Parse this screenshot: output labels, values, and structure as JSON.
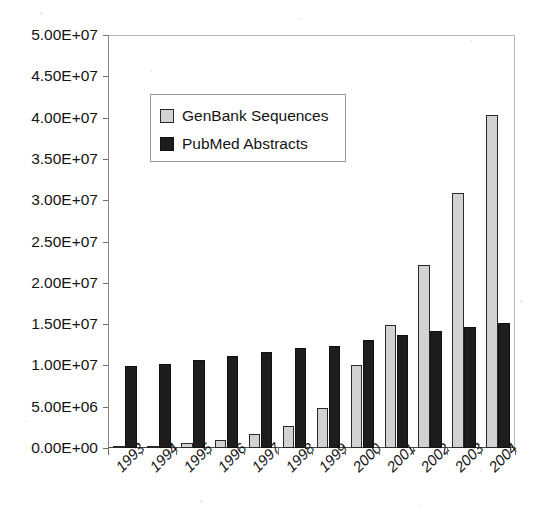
{
  "chart_data": {
    "type": "bar",
    "title": "",
    "subtitle": "",
    "xlabel": "",
    "ylabel": "",
    "categories": [
      "1993",
      "1994",
      "1995",
      "1996",
      "1997",
      "1998",
      "1999",
      "2000",
      "2001",
      "2002",
      "2003",
      "2004"
    ],
    "series": [
      {
        "name": "GenBank Sequences",
        "color": "#d2d2d2",
        "values": [
          160000,
          280000,
          560000,
          1020000,
          1750000,
          2650000,
          4800000,
          10100000,
          14900000,
          22200000,
          30900000,
          40300000
        ]
      },
      {
        "name": "PubMed Abstracts",
        "color": "#1d1d1d",
        "values": [
          9900000,
          10200000,
          10650000,
          11150000,
          11600000,
          12050000,
          12400000,
          13100000,
          13650000,
          14200000,
          14650000,
          15150000
        ]
      }
    ],
    "ylim": [
      0,
      50000000
    ],
    "ytick_values": [
      0,
      5000000,
      10000000,
      15000000,
      20000000,
      25000000,
      30000000,
      35000000,
      40000000,
      45000000,
      50000000
    ],
    "ytick_labels": [
      "0.00E+00",
      "5.00E+06",
      "1.00E+07",
      "1.50E+07",
      "2.00E+07",
      "2.50E+07",
      "3.00E+07",
      "3.50E+07",
      "4.00E+07",
      "4.50E+07",
      "5.00E+07"
    ],
    "grid": false,
    "legend_position": "upper-left-inside",
    "annotations": []
  },
  "legend": {
    "items": [
      {
        "label": "GenBank Sequences",
        "swatch": "genbank-swatch"
      },
      {
        "label": "PubMed Abstracts",
        "swatch": "pubmed-swatch"
      }
    ]
  }
}
